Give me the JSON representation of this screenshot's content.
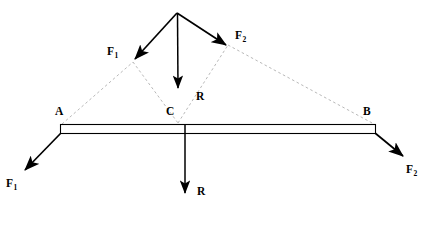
{
  "figure": {
    "type": "free-body-force-diagram",
    "title": "",
    "canvas": {
      "width": 425,
      "height": 230,
      "background": "#ffffff"
    }
  },
  "colors": {
    "stroke": "#000000",
    "construction": "#b0b0b0",
    "beam_outline": "#000000",
    "beam_fill": "#ffffff",
    "background": "#ffffff"
  },
  "labels": {
    "force_1_upper": {
      "text": "F",
      "sub": "1"
    },
    "force_2_upper": {
      "text": "F",
      "sub": "2"
    },
    "resultant_upper": {
      "text": "R",
      "sub": ""
    },
    "point_a": {
      "text": "A",
      "sub": ""
    },
    "point_b": {
      "text": "B",
      "sub": ""
    },
    "point_c": {
      "text": "C",
      "sub": ""
    },
    "force_1_lower": {
      "text": "F",
      "sub": "1"
    },
    "force_2_lower": {
      "text": "F",
      "sub": "2"
    },
    "resultant_lower": {
      "text": "R",
      "sub": ""
    }
  },
  "geometry": {
    "apex": {
      "x": 177,
      "y": 13
    },
    "point_a": {
      "x": 62,
      "y": 124
    },
    "point_b": {
      "x": 374,
      "y": 124
    },
    "point_c": {
      "x": 178,
      "y": 124
    },
    "parallelogram_left_vertex": {
      "x": 133,
      "y": 62
    },
    "parallelogram_right_vertex": {
      "x": 228,
      "y": 45
    },
    "resultant_head": {
      "x": 178,
      "y": 92
    },
    "beam": {
      "x1": 60,
      "y1": 124,
      "x2": 376,
      "y2": 133,
      "thickness": 9
    },
    "vectors": [
      {
        "name": "F1-upper",
        "x1": 177,
        "y1": 13,
        "x2": 133,
        "y2": 61
      },
      {
        "name": "F2-upper",
        "x1": 177,
        "y1": 13,
        "x2": 228,
        "y2": 46
      },
      {
        "name": "R-upper",
        "x1": 177,
        "y1": 13,
        "x2": 178,
        "y2": 92
      },
      {
        "name": "F1-lower",
        "x1": 61,
        "y1": 133,
        "x2": 22,
        "y2": 173
      },
      {
        "name": "F2-lower",
        "x1": 375,
        "y1": 133,
        "x2": 406,
        "y2": 159
      },
      {
        "name": "R-lower",
        "x1": 185,
        "y1": 133,
        "x2": 185,
        "y2": 197
      }
    ],
    "construction_lines": [
      {
        "name": "A-to-left-vertex",
        "x1": 62,
        "y1": 124,
        "x2": 133,
        "y2": 62
      },
      {
        "name": "left-vertex-to-C",
        "x1": 133,
        "y1": 62,
        "x2": 178,
        "y2": 122
      },
      {
        "name": "C-to-right-vertex",
        "x1": 178,
        "y1": 122,
        "x2": 228,
        "y2": 45
      },
      {
        "name": "right-vertex-to-B",
        "x1": 228,
        "y1": 45,
        "x2": 374,
        "y2": 124
      }
    ]
  }
}
